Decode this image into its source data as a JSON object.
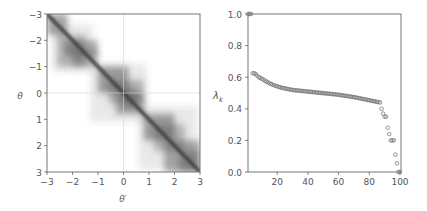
{
  "chart_data": [
    {
      "type": "heatmap",
      "title": "",
      "xlabel": "θ′",
      "ylabel": "θ",
      "xlim": [
        -3,
        3
      ],
      "ylim": [
        -3,
        3
      ],
      "y_inverted": true,
      "xticks": [
        "-3",
        "-2",
        "-1",
        "0",
        "1",
        "2",
        "3"
      ],
      "yticks": [
        "-3",
        "-2",
        "-1",
        "0",
        "1",
        "2",
        "3"
      ],
      "grid": "faint lines at x=0 and y=0",
      "colormap": "greys",
      "description": "Kernel concentrated on the diagonal θ=θ′ with block-structured blobs; pinch points near θ≈-1 and θ≈0.8",
      "blocks": [
        {
          "from": -3.0,
          "to": -1.0,
          "sub_split": -2.0
        },
        {
          "from": -1.0,
          "to": 0.8,
          "sub_split": 0.0
        },
        {
          "from": 0.8,
          "to": 3.0,
          "sub_split": 1.8
        }
      ]
    },
    {
      "type": "scatter",
      "title": "",
      "xlabel": "",
      "ylabel": "λk",
      "xlim": [
        0,
        100
      ],
      "ylim": [
        0.0,
        1.0
      ],
      "xticks": [
        "20",
        "40",
        "60",
        "80",
        "100"
      ],
      "yticks": [
        "0.0",
        "0.2",
        "0.4",
        "0.6",
        "0.8",
        "1.0"
      ],
      "grid": false,
      "marker": "open circle",
      "x": [
        1,
        2,
        3,
        4,
        5,
        6,
        7,
        8,
        9,
        10,
        11,
        12,
        13,
        14,
        15,
        16,
        17,
        18,
        19,
        20,
        21,
        22,
        23,
        24,
        25,
        26,
        27,
        28,
        29,
        30,
        31,
        32,
        33,
        34,
        35,
        36,
        37,
        38,
        39,
        40,
        41,
        42,
        43,
        44,
        45,
        46,
        47,
        48,
        49,
        50,
        51,
        52,
        53,
        54,
        55,
        56,
        57,
        58,
        59,
        60,
        61,
        62,
        63,
        64,
        65,
        66,
        67,
        68,
        69,
        70,
        71,
        72,
        73,
        74,
        75,
        76,
        77,
        78,
        79,
        80,
        81,
        82,
        83,
        84,
        85,
        86,
        87,
        88,
        89,
        90,
        91,
        92,
        93,
        94,
        95,
        96,
        97,
        98,
        99,
        100
      ],
      "values": [
        1.0,
        1.0,
        1.0,
        0.625,
        0.625,
        0.62,
        0.61,
        0.6,
        0.595,
        0.59,
        0.585,
        0.578,
        0.572,
        0.567,
        0.562,
        0.557,
        0.553,
        0.549,
        0.545,
        0.542,
        0.539,
        0.536,
        0.533,
        0.531,
        0.529,
        0.527,
        0.525,
        0.523,
        0.521,
        0.52,
        0.518,
        0.517,
        0.516,
        0.515,
        0.514,
        0.513,
        0.512,
        0.511,
        0.51,
        0.509,
        0.508,
        0.507,
        0.506,
        0.505,
        0.504,
        0.503,
        0.502,
        0.501,
        0.5,
        0.499,
        0.498,
        0.497,
        0.496,
        0.495,
        0.494,
        0.493,
        0.492,
        0.491,
        0.49,
        0.489,
        0.487,
        0.486,
        0.484,
        0.483,
        0.481,
        0.48,
        0.478,
        0.477,
        0.475,
        0.474,
        0.472,
        0.47,
        0.468,
        0.466,
        0.464,
        0.462,
        0.46,
        0.458,
        0.456,
        0.454,
        0.452,
        0.45,
        0.448,
        0.446,
        0.444,
        0.442,
        0.44,
        0.4,
        0.37,
        0.35,
        0.35,
        0.28,
        0.24,
        0.2,
        0.2,
        0.2,
        0.11,
        0.055,
        0.0,
        0.0
      ]
    }
  ],
  "left_panel": {
    "xlabel": "θ′",
    "ylabel": "θ",
    "xticks": [
      "−3",
      "−2",
      "−1",
      "0",
      "1",
      "2",
      "3"
    ],
    "yticks": [
      "−3",
      "−2",
      "−1",
      "0",
      "1",
      "2",
      "3"
    ]
  },
  "right_panel": {
    "ylabel_main": "λ",
    "ylabel_sub": "k",
    "xticks": [
      "20",
      "40",
      "60",
      "80",
      "100"
    ],
    "yticks": [
      "0.0",
      "0.2",
      "0.4",
      "0.6",
      "0.8",
      "1.0"
    ]
  },
  "colors": {
    "axis": "#555555",
    "marker": "#6b6b6b",
    "heat": "#4a4a4a",
    "grid": "#d0d0d0"
  }
}
